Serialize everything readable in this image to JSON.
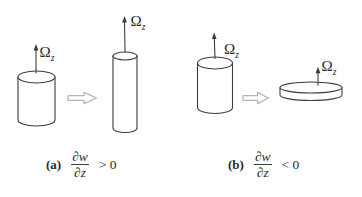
{
  "colors": {
    "line": "#3d3d3d",
    "arrow_outline": "#adb6b6",
    "text": "#2b2b2b",
    "background": "#ffffff"
  },
  "panels": [
    {
      "caption": {
        "label": "(a)",
        "frac_num": "∂w",
        "frac_den": "∂z",
        "relation": "> 0"
      },
      "before_shape": "cylinder",
      "after_shape": "tall-thin-cylinder",
      "omega_before": {
        "symbol": "Ω",
        "subscript": "z"
      },
      "omega_after": {
        "symbol": "Ω",
        "subscript": "z"
      }
    },
    {
      "caption": {
        "label": "(b)",
        "frac_num": "∂w",
        "frac_den": "∂z",
        "relation": "< 0"
      },
      "before_shape": "cylinder",
      "after_shape": "flat-disk",
      "omega_before": {
        "symbol": "Ω",
        "subscript": "z"
      },
      "omega_after": {
        "symbol": "Ω",
        "subscript": "z"
      }
    }
  ]
}
